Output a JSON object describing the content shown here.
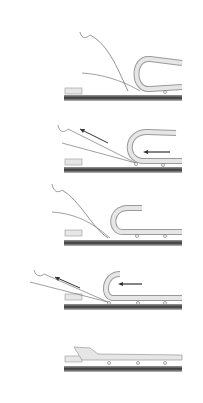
{
  "figure": {
    "type": "surgical-sequence-illustration",
    "panel_count": 5,
    "colors": {
      "background": "#ffffff",
      "line": "#777777",
      "ground_dark": "#3a3a3a",
      "ground_light": "#bdbdbd",
      "flap_fill": "#e6e6e6",
      "flap_stroke": "#9a9a9a",
      "arrow": "#333333"
    },
    "panels": [
      {
        "step": 1,
        "top": 25,
        "height": 85,
        "state": "flap-folded-back",
        "arrow": false,
        "instrument": "curved-hook",
        "nodes": 1
      },
      {
        "step": 2,
        "top": 115,
        "height": 65,
        "state": "flap-folded-back",
        "arrow": true,
        "instrument": "straight-probe",
        "nodes": 2
      },
      {
        "step": 3,
        "top": 180,
        "height": 75,
        "state": "flap-partially-folded",
        "arrow": false,
        "instrument": "curved-hook",
        "nodes": 3
      },
      {
        "step": 4,
        "top": 262,
        "height": 58,
        "state": "flap-small-curl",
        "arrow": true,
        "instrument": "straight-probe",
        "nodes": 3
      },
      {
        "step": 5,
        "top": 340,
        "height": 40,
        "state": "flap-repositioned",
        "arrow": false,
        "instrument": "none",
        "nodes": 3
      }
    ]
  }
}
